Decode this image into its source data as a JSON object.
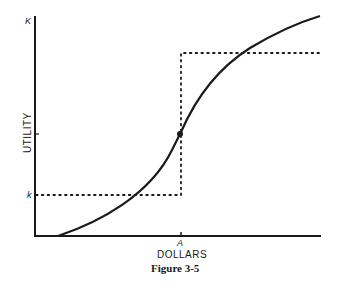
{
  "figure": {
    "caption": "Figure 3-5",
    "x_axis_label": "DOLLARS",
    "y_axis_label": "UTILITY",
    "x_tick_label": "A",
    "y_tick_upper": "K",
    "y_tick_lower": "k"
  },
  "colors": {
    "ink": "#1a1a1a",
    "background": "#ffffff"
  }
}
